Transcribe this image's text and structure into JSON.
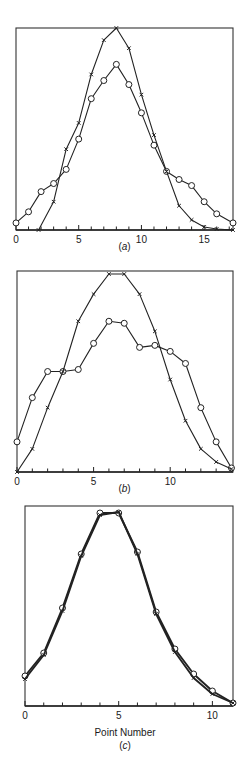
{
  "chart_data": [
    {
      "id": "a",
      "type": "line",
      "panel_label": "a",
      "title": "",
      "xlabel": "",
      "ylabel": "",
      "xlim": [
        0,
        17.3
      ],
      "ylim": [
        0,
        1
      ],
      "xticks": [
        0,
        1,
        2,
        3,
        4,
        5,
        6,
        7,
        8,
        9,
        10,
        11,
        12,
        13,
        14,
        15,
        16,
        17
      ],
      "xtick_labels": {
        "0": "0",
        "5": "5",
        "10": "10",
        "15": "15"
      },
      "grid": false,
      "legend": null,
      "series": [
        {
          "name": "circles",
          "marker": "o",
          "x": [
            0,
            1,
            2,
            3,
            4,
            5,
            6,
            7,
            8,
            9,
            10,
            11,
            12,
            13,
            14,
            15,
            16,
            17.3
          ],
          "values": [
            0.035,
            0.09,
            0.19,
            0.23,
            0.3,
            0.45,
            0.65,
            0.74,
            0.82,
            0.72,
            0.58,
            0.42,
            0.29,
            0.25,
            0.22,
            0.14,
            0.08,
            0.035
          ]
        },
        {
          "name": "crosses",
          "marker": "x",
          "x": [
            1.8,
            3,
            4,
            5,
            6,
            7,
            8,
            9,
            10,
            11,
            12,
            13,
            14,
            15,
            16,
            17.3
          ],
          "values": [
            0.0,
            0.14,
            0.4,
            0.53,
            0.77,
            0.94,
            1.0,
            0.9,
            0.67,
            0.47,
            0.29,
            0.12,
            0.05,
            0.015,
            0.005,
            0.0
          ]
        }
      ]
    },
    {
      "id": "b",
      "type": "line",
      "panel_label": "b",
      "title": "",
      "xlabel": "",
      "ylabel": "",
      "xlim": [
        0,
        14.1
      ],
      "ylim": [
        0,
        1
      ],
      "xticks": [
        0,
        1,
        2,
        3,
        4,
        5,
        6,
        7,
        8,
        9,
        10,
        11,
        12,
        13,
        14
      ],
      "xtick_labels": {
        "0": "0",
        "5": "5",
        "10": "10"
      },
      "grid": false,
      "legend": null,
      "series": [
        {
          "name": "circles",
          "marker": "o",
          "x": [
            0,
            1,
            2,
            3,
            4,
            5,
            6,
            7,
            8,
            9,
            10,
            11,
            12,
            13,
            14
          ],
          "values": [
            0.15,
            0.37,
            0.5,
            0.5,
            0.51,
            0.64,
            0.75,
            0.74,
            0.62,
            0.63,
            0.6,
            0.54,
            0.32,
            0.15,
            0.02
          ]
        },
        {
          "name": "crosses",
          "marker": "x",
          "x": [
            0,
            1,
            2,
            3,
            4,
            5,
            6,
            7,
            8,
            9,
            10,
            11,
            12,
            13,
            14
          ],
          "values": [
            0.0,
            0.115,
            0.32,
            0.5,
            0.75,
            0.885,
            0.985,
            0.985,
            0.885,
            0.7,
            0.46,
            0.255,
            0.115,
            0.05,
            0.015
          ]
        }
      ]
    },
    {
      "id": "c",
      "type": "line",
      "panel_label": "c",
      "title": "",
      "xlabel": "Point Number",
      "ylabel": "",
      "xlim": [
        0,
        11.1
      ],
      "ylim": [
        0,
        1
      ],
      "xticks": [
        0,
        1,
        2,
        3,
        4,
        5,
        6,
        7,
        8,
        9,
        10,
        11
      ],
      "xtick_labels": {
        "0": "0",
        "5": "5",
        "10": "10"
      },
      "grid": false,
      "legend": null,
      "series": [
        {
          "name": "circles",
          "marker": "o",
          "x": [
            0,
            1,
            2,
            3,
            4,
            5,
            6,
            7,
            8,
            9,
            10,
            11.1
          ],
          "values": [
            0.15,
            0.265,
            0.49,
            0.76,
            0.965,
            0.965,
            0.77,
            0.47,
            0.285,
            0.16,
            0.075,
            0.015
          ]
        },
        {
          "name": "crosses",
          "marker": "x",
          "x": [
            0,
            1,
            2,
            3,
            4,
            5,
            6,
            7,
            8,
            9,
            10,
            11.1
          ],
          "values": [
            0.135,
            0.255,
            0.475,
            0.75,
            0.955,
            0.97,
            0.76,
            0.46,
            0.27,
            0.14,
            0.06,
            0.015
          ]
        }
      ]
    }
  ],
  "panels": {
    "a": {
      "label_prefix": "(",
      "label_letter": "a",
      "label_suffix": ")"
    },
    "b": {
      "label_prefix": "(",
      "label_letter": "b",
      "label_suffix": ")"
    },
    "c": {
      "label_prefix": "(",
      "label_letter": "c",
      "label_suffix": ")",
      "xlabel": "Point Number"
    }
  }
}
